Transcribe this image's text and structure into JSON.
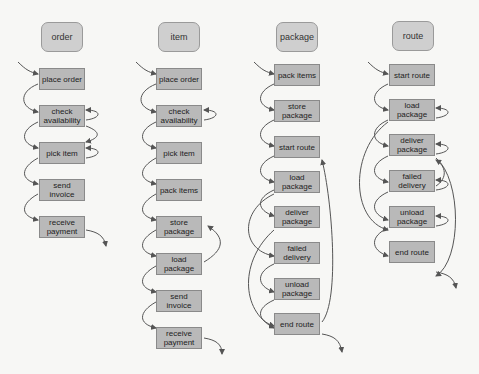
{
  "diagram": {
    "colors": {
      "head_fill": "#cfcfcf",
      "step_fill": "#b9b9b9",
      "arrow": "#555555",
      "background": "#f7f7f5"
    },
    "columns": [
      {
        "title": "order",
        "steps": [
          "place order",
          "check availability",
          "pick item",
          "send invoice",
          "receive payment"
        ]
      },
      {
        "title": "item",
        "steps": [
          "place order",
          "check availability",
          "pick item",
          "pack items",
          "store package",
          "load package",
          "send invoice",
          "receive payment"
        ]
      },
      {
        "title": "package",
        "steps": [
          "pack items",
          "store package",
          "start route",
          "load package",
          "deliver package",
          "failed delivery",
          "unload package",
          "end route"
        ]
      },
      {
        "title": "route",
        "steps": [
          "start route",
          "load package",
          "deliver package",
          "failed delivery",
          "unload package",
          "end route"
        ]
      }
    ]
  }
}
